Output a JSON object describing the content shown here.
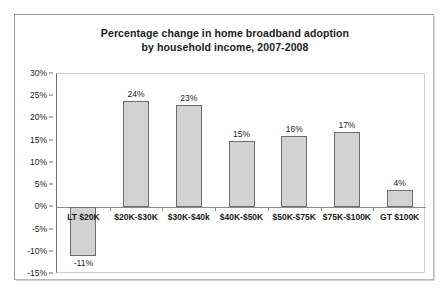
{
  "chart_data": {
    "type": "bar",
    "title": "Percentage change in home broadband adoption by household income, 2007-2008",
    "title_lines": [
      "Percentage change in home broadband adoption",
      "by household income, 2007-2008"
    ],
    "xlabel": "",
    "ylabel": "",
    "ylim": [
      -15,
      30
    ],
    "ytick_step": 5,
    "grid": false,
    "legend": false,
    "bar_fill_color": "#d2d2d2",
    "bar_border_color": "#6d6d6d",
    "categories": [
      "LT $20K",
      "$20K-$30K",
      "$30K-$40k",
      "$40K-$50K",
      "$50K-$75K",
      "$75K-$100K",
      "GT $100K"
    ],
    "values": [
      -11,
      24,
      23,
      15,
      16,
      17,
      4
    ],
    "data_labels": [
      "-11%",
      "24%",
      "23%",
      "15%",
      "16%",
      "17%",
      "4%"
    ],
    "ytick_labels": [
      "30%",
      "25%",
      "20%",
      "15%",
      "10%",
      "5%",
      "0%",
      "-5%",
      "-10%",
      "-15%"
    ],
    "ytick_values": [
      30,
      25,
      20,
      15,
      10,
      5,
      0,
      -5,
      -10,
      -15
    ]
  }
}
